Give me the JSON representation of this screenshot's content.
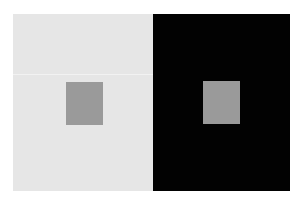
{
  "caption": {
    "text": ""
  },
  "illustration": {
    "type": "simultaneous-contrast",
    "panels": [
      {
        "name": "light-background",
        "background_color": "#e6e6e6",
        "swatch_color": "#9a9a9a"
      },
      {
        "name": "dark-background",
        "background_color": "#020202",
        "swatch_color": "#9a9a9a"
      }
    ]
  }
}
